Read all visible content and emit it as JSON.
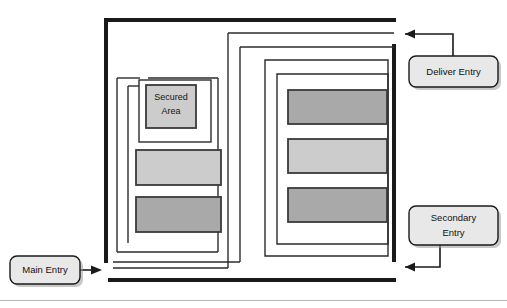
{
  "diagram": {
    "type": "floor-plan-diagram",
    "canvas": {
      "width": 507,
      "height": 308
    },
    "background_color": "#ffffff",
    "line_color": "#1a1a1a",
    "colors": {
      "wall_thick": "#1a1a1a",
      "wall_thin": "#2b2b2b",
      "room_fill_dark": "#a9a9a9",
      "room_fill_light": "#cccccc",
      "room_stroke": "#3a3a3a",
      "callout_fill": "#e8e8e8",
      "callout_stroke": "#1a1a1a",
      "callout_shadow": "#9a9a9a",
      "footer_rule": "#b8b8b8"
    },
    "rooms": [
      {
        "id": "secured-area",
        "label_line_1": "Secured",
        "label_line_2": "Area",
        "fill": "#cccccc",
        "x": 146,
        "y": 85,
        "w": 50,
        "h": 43
      },
      {
        "id": "left-room-upper",
        "label": "",
        "fill": "#cccccc",
        "x": 136,
        "y": 150,
        "w": 85,
        "h": 35
      },
      {
        "id": "left-room-lower",
        "label": "",
        "fill": "#a9a9a9",
        "x": 136,
        "y": 197,
        "w": 85,
        "h": 35
      },
      {
        "id": "right-room-top",
        "label": "",
        "fill": "#a9a9a9",
        "x": 288,
        "y": 90,
        "w": 99,
        "h": 34
      },
      {
        "id": "right-room-middle",
        "label": "",
        "fill": "#cccccc",
        "x": 288,
        "y": 139,
        "w": 99,
        "h": 34
      },
      {
        "id": "right-room-bottom",
        "label": "",
        "fill": "#a9a9a9",
        "x": 288,
        "y": 188,
        "w": 99,
        "h": 34
      }
    ],
    "callouts": [
      {
        "id": "deliver-entry",
        "label_line_1": "Deliver Entry",
        "label_line_2": "",
        "box": {
          "x": 409,
          "y": 56,
          "w": 89,
          "h": 31
        },
        "arrow_target": "top-right-corridor"
      },
      {
        "id": "secondary-entry",
        "label_line_1": "Secondary",
        "label_line_2": "Entry",
        "box": {
          "x": 409,
          "y": 206,
          "w": 89,
          "h": 39
        },
        "arrow_target": "bottom-right-corridor"
      },
      {
        "id": "main-entry",
        "label_line_1": "Main Entry",
        "label_line_2": "",
        "box": {
          "x": 10,
          "y": 256,
          "w": 70,
          "h": 28
        },
        "arrow_target": "bottom-left-corridor"
      }
    ]
  }
}
